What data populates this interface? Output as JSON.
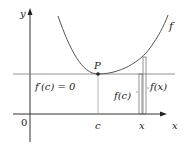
{
  "figure": {
    "labels": {
      "y_axis": "y",
      "x_axis": "x",
      "origin": "0",
      "point": "P",
      "curve": "f",
      "derivative": "f′(c) = 0",
      "c_tick": "c",
      "x_tick": "x",
      "f_c": "f(c)",
      "f_x": "f(x)"
    },
    "colors": {
      "axes": "#333333",
      "curve": "#555555",
      "tangent": "#666666",
      "text": "#222222"
    }
  }
}
